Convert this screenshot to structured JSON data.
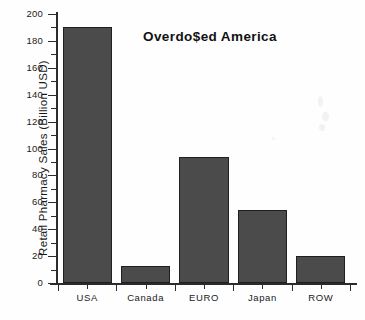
{
  "chart_data": {
    "type": "bar",
    "title": "Overdo$ed America",
    "subtitle": "",
    "xlabel": "",
    "ylabel": "Retail Pharmacy Sales (Billion USD)",
    "categories": [
      "USA",
      "Canada",
      "EURO",
      "Japan",
      "ROW"
    ],
    "values": [
      190,
      13,
      94,
      54,
      20
    ],
    "ylim": [
      0,
      200
    ],
    "ytick_step": 20,
    "yticks": [
      0,
      20,
      40,
      60,
      80,
      100,
      120,
      140,
      160,
      180,
      200
    ],
    "ytick_labels": [
      "0",
      "20",
      "40",
      "60",
      "80",
      "100",
      "120",
      "140",
      "160",
      "180",
      "200"
    ],
    "minor_ticks": true,
    "grid": false,
    "legend": null,
    "bar_color": "#4b4b4b",
    "bar_edge_color": "#1f1f1f",
    "axis_color": "#2b2b2b",
    "background_color": "#fefefe",
    "series": [
      {
        "name": "Retail Pharmacy Sales",
        "values": [
          190,
          13,
          94,
          54,
          20
        ]
      }
    ]
  }
}
